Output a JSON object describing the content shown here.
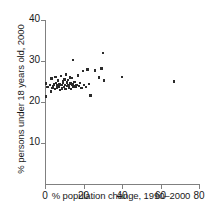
{
  "chart_data": {
    "type": "scatter",
    "title": "",
    "xlabel": "% population change, 1990–2000",
    "ylabel": "% persons under 18 years old, 2000",
    "xlim": [
      0,
      80
    ],
    "ylim": [
      0,
      40
    ],
    "xticks": [
      0,
      20,
      40,
      60,
      80
    ],
    "yticks": [
      10,
      20,
      30,
      40
    ],
    "xtick_labels": [
      "0",
      "20",
      "40",
      "60",
      "80"
    ],
    "ytick_labels": [
      "10",
      "20",
      "30",
      "40"
    ],
    "grid": false,
    "legend": null,
    "marker_color": "#2b2b2b",
    "axis_color": "#808080",
    "points": [
      [
        0.5,
        21.3
      ],
      [
        0.6,
        24.5
      ],
      [
        1.3,
        23.6
      ],
      [
        2.6,
        24.2
      ],
      [
        3.1,
        22.6
      ],
      [
        3.4,
        25.7
      ],
      [
        3.8,
        23.4
      ],
      [
        4.2,
        23.9
      ],
      [
        4.6,
        24.3
      ],
      [
        5.1,
        23.2
      ],
      [
        5.4,
        26.1
      ],
      [
        5.8,
        24.7
      ],
      [
        6.2,
        23.5
      ],
      [
        6.5,
        24.0
      ],
      [
        6.9,
        25.2
      ],
      [
        7.2,
        23.8
      ],
      [
        7.6,
        24.4
      ],
      [
        7.9,
        22.9
      ],
      [
        8.3,
        26.4
      ],
      [
        8.6,
        24.1
      ],
      [
        8.9,
        23.3
      ],
      [
        9.2,
        25.0
      ],
      [
        9.5,
        24.6
      ],
      [
        9.8,
        23.7
      ],
      [
        10.1,
        25.5
      ],
      [
        10.4,
        24.2
      ],
      [
        10.7,
        23.1
      ],
      [
        11.0,
        26.7
      ],
      [
        11.3,
        24.8
      ],
      [
        11.6,
        23.9
      ],
      [
        11.9,
        25.3
      ],
      [
        12.3,
        24.0
      ],
      [
        12.6,
        23.5
      ],
      [
        12.9,
        26.0
      ],
      [
        13.2,
        24.5
      ],
      [
        13.6,
        23.2
      ],
      [
        13.9,
        25.8
      ],
      [
        14.2,
        24.3
      ],
      [
        14.6,
        30.3
      ],
      [
        14.9,
        23.8
      ],
      [
        15.3,
        24.9
      ],
      [
        15.8,
        23.6
      ],
      [
        16.4,
        24.2
      ],
      [
        17.0,
        26.5
      ],
      [
        17.6,
        23.9
      ],
      [
        18.3,
        24.6
      ],
      [
        19.0,
        23.4
      ],
      [
        19.8,
        27.6
      ],
      [
        20.4,
        24.1
      ],
      [
        21.2,
        23.7
      ],
      [
        22.0,
        27.9
      ],
      [
        22.8,
        24.4
      ],
      [
        23.6,
        21.6
      ],
      [
        25.9,
        27.7
      ],
      [
        28.2,
        26.0
      ],
      [
        29.4,
        28.2
      ],
      [
        30.1,
        32.0
      ],
      [
        30.8,
        25.2
      ],
      [
        40.0,
        26.1
      ],
      [
        67.0,
        25.0
      ]
    ]
  }
}
